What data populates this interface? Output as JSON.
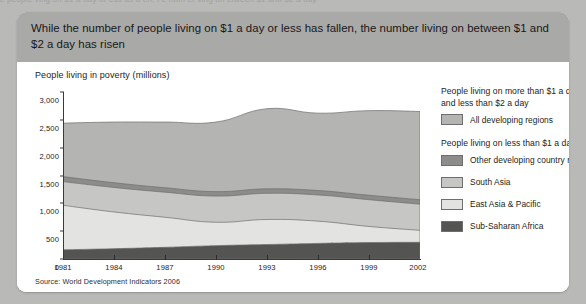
{
  "page": {
    "top_cut_text": "e people ving on $1 a day or ess as a en, t e num er ving on etween $1 and $2 a day"
  },
  "panel": {
    "header_text": "While the number of people living on $1 a day or less has fallen, the number living on between $1 and $2 a day has risen",
    "source": "Source: World Development Indicators 2006"
  },
  "colors": {
    "header_bg": "#a9a9a7",
    "page_bg": "#b9b9b7",
    "panel_bg": "#ffffff",
    "all_developing_regions": "#b4b4b2",
    "other_developing_country_regions": "#8c8c8a",
    "south_asia": "#c6c6c4",
    "east_asia_pacific": "#e3e3e1",
    "sub_saharan_africa": "#545452",
    "axis": "#3a3a3a"
  },
  "legend": {
    "groups": [
      {
        "heading": "People living on more than $1 a day and less than $2 a day",
        "items": [
          {
            "label": "All developing regions",
            "color": "#b4b4b2"
          }
        ]
      },
      {
        "heading": "People living on less than $1 a day",
        "items": [
          {
            "label": "Other developing country regions",
            "color": "#8c8c8a"
          },
          {
            "label": "South Asia",
            "color": "#c6c6c4"
          },
          {
            "label": "East Asia & Pacific",
            "color": "#e3e3e1"
          },
          {
            "label": "Sub-Saharan Africa",
            "color": "#545452"
          }
        ]
      }
    ]
  },
  "chart_data": {
    "type": "area",
    "title": "People living in poverty (millions)",
    "xlabel": "",
    "ylabel": "People living in poverty (millions)",
    "ylim": [
      0,
      3000
    ],
    "xlim": [
      1981,
      2002
    ],
    "grid": false,
    "legend_position": "right",
    "stacked": true,
    "ytick_labels": [
      "0",
      "500",
      "1,000",
      "1,500",
      "2,000",
      "2,500",
      "3,000"
    ],
    "yticks": [
      0,
      500,
      1000,
      1500,
      2000,
      2500,
      3000
    ],
    "xtick_labels": [
      "1981",
      "1984",
      "1987",
      "1990",
      "1993",
      "1996",
      "1999",
      "2002"
    ],
    "xticks": [
      1981,
      1984,
      1987,
      1990,
      1993,
      1996,
      1999,
      2002
    ],
    "x": [
      1981,
      1984,
      1987,
      1990,
      1993,
      1996,
      1999,
      2002
    ],
    "series": [
      {
        "name": "Sub-Saharan Africa",
        "color": "#545452",
        "values": [
          165,
          185,
          210,
          240,
          260,
          280,
          295,
          300
        ]
      },
      {
        "name": "East Asia & Pacific",
        "color": "#e3e3e1",
        "values": [
          800,
          660,
          540,
          420,
          450,
          400,
          290,
          215
        ]
      },
      {
        "name": "South Asia",
        "color": "#c6c6c4",
        "values": [
          425,
          440,
          450,
          470,
          470,
          470,
          480,
          470
        ]
      },
      {
        "name": "Other developing country regions",
        "color": "#8c8c8a",
        "values": [
          90,
          85,
          80,
          80,
          80,
          80,
          80,
          80
        ]
      },
      {
        "name": "All developing regions",
        "color": "#b4b4b2",
        "values": [
          960,
          1090,
          1180,
          1250,
          1440,
          1390,
          1520,
          1585
        ]
      }
    ],
    "cumulative_tops": {
      "sub_saharan_africa": [
        165,
        185,
        210,
        240,
        260,
        280,
        295,
        300
      ],
      "east_asia_pacific": [
        965,
        845,
        750,
        660,
        710,
        680,
        585,
        515
      ],
      "south_asia": [
        1390,
        1285,
        1200,
        1130,
        1180,
        1150,
        1065,
        985
      ],
      "other_developing_country_regions": [
        1480,
        1370,
        1280,
        1210,
        1260,
        1230,
        1145,
        1065
      ],
      "total": [
        2440,
        2460,
        2460,
        2460,
        2700,
        2620,
        2665,
        2650
      ]
    }
  }
}
